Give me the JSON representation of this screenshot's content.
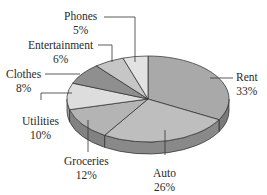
{
  "chart_data": {
    "type": "pie",
    "style": "3d",
    "title": "",
    "categories": [
      "Rent",
      "Auto",
      "Groceries",
      "Utilities",
      "Clothes",
      "Entertainment",
      "Phones"
    ],
    "values": [
      33,
      26,
      12,
      10,
      8,
      6,
      5
    ],
    "value_labels": [
      "33%",
      "26%",
      "12%",
      "10%",
      "8%",
      "6%",
      "5%"
    ],
    "colors": [
      "#a9a9a9",
      "#bebebe",
      "#b4b4b4",
      "#dddddd",
      "#8f8f8f",
      "#c6c6c6",
      "#e2e2e2"
    ],
    "start_angle": "12 o'clock",
    "direction": "clockwise",
    "legend": "none (leader-line labels)"
  },
  "labels": {
    "rent": {
      "name": "Rent",
      "pct": "33%"
    },
    "auto": {
      "name": "Auto",
      "pct": "26%"
    },
    "groceries": {
      "name": "Groceries",
      "pct": "12%"
    },
    "utilities": {
      "name": "Utilities",
      "pct": "10%"
    },
    "clothes": {
      "name": "Clothes",
      "pct": "8%"
    },
    "entertainment": {
      "name": "Entertainment",
      "pct": "6%"
    },
    "phones": {
      "name": "Phones",
      "pct": "5%"
    }
  }
}
